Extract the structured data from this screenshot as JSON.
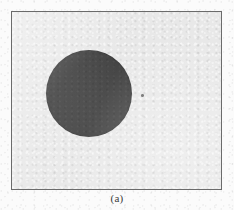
{
  "figure": {
    "caption": "(a)",
    "frame": {
      "border_color": "#6b6b6b",
      "background_color": "#e8e8e8",
      "left": 11,
      "top": 11,
      "width": 211,
      "height": 179
    },
    "page_background_color": "#fbfbfb"
  },
  "shapes": {
    "disc": {
      "label": "dark filled circle",
      "fill_color": "#3b3b3b",
      "center_x": 88,
      "center_y": 93,
      "diameter": 86
    },
    "speck": {
      "label": "small dark speck artifact",
      "fill_color": "#555555",
      "center_x": 141,
      "center_y": 94,
      "size": 3
    }
  }
}
